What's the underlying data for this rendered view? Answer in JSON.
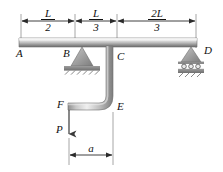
{
  "figure": {
    "background_color": "#ffffff",
    "line_color": "#2b2b2b",
    "member_light": "#f2f2f2",
    "member_mid": "#b8b8b8",
    "member_dark": "#6e6e6e",
    "ground_color": "#8c8c8c"
  },
  "points": {
    "a": "A",
    "b": "B",
    "c": "C",
    "d": "D",
    "e": "E",
    "f": "F"
  },
  "dimensions": {
    "top": [
      {
        "id": "dim-L-over-2",
        "numerator": "L",
        "denominator": "2",
        "label": "L/2"
      },
      {
        "id": "dim-L-over-3",
        "numerator": "L",
        "denominator": "3",
        "label": "L/3"
      },
      {
        "id": "dim-2L-over-3",
        "numerator": "2L",
        "denominator": "3",
        "label": "2L/3"
      }
    ],
    "bottom": {
      "id": "dim-a",
      "label": "a"
    }
  },
  "loads": [
    {
      "id": "load-P",
      "label": "P",
      "direction": "down",
      "applied_at": "F"
    }
  ],
  "supports": [
    {
      "id": "support-B",
      "type": "pin",
      "at": "B",
      "label": "B"
    },
    {
      "id": "support-D",
      "type": "roller",
      "at": "D",
      "label": "D",
      "roller_count": 3
    }
  ]
}
